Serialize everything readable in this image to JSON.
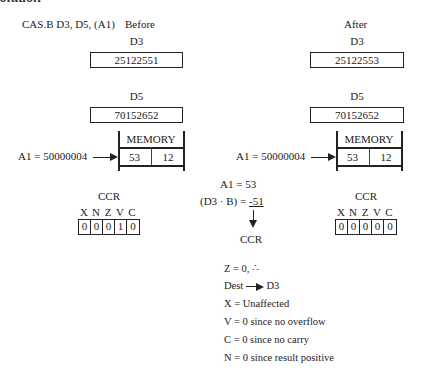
{
  "section_title": "olution",
  "instruction": "CAS.B D3, D5, (A1)",
  "before": {
    "label": "Before",
    "d3": {
      "label": "D3",
      "value": "25122551"
    },
    "d5": {
      "label": "D5",
      "value": "70152652"
    },
    "memory": {
      "title": "MEMORY",
      "cells": [
        "53",
        "12"
      ],
      "pointer_label": "A1 = 50000004"
    },
    "ccr": {
      "label": "CCR",
      "flags": [
        "X",
        "N",
        "Z",
        "V",
        "C"
      ],
      "bits": [
        "0",
        "0",
        "0",
        "1",
        "0"
      ]
    }
  },
  "after": {
    "label": "After",
    "d3": {
      "label": "D3",
      "value": "25122553"
    },
    "d5": {
      "label": "D5",
      "value": "70152652"
    },
    "memory": {
      "title": "MEMORY",
      "cells": [
        "53",
        "12"
      ],
      "pointer_label": "A1 = 50000004"
    },
    "ccr": {
      "label": "CCR",
      "flags": [
        "X",
        "N",
        "Z",
        "V",
        "C"
      ],
      "bits": [
        "0",
        "0",
        "0",
        "0",
        "0"
      ]
    }
  },
  "computation": {
    "line1": "A1 = 53",
    "line2_prefix": "(D3 · B) =",
    "line2_value": "-51",
    "result_target": "CCR"
  },
  "notes": {
    "z": "Z = 0, ∴",
    "dest_prefix": "Dest",
    "dest_target": "D3",
    "x": "X = Unaffected",
    "v": "V = 0 since no overflow",
    "c": "C = 0 since no carry",
    "n": "N = 0 since result positive"
  }
}
